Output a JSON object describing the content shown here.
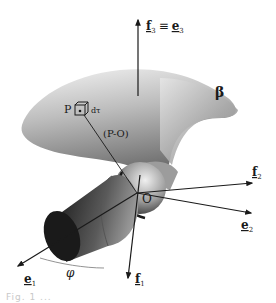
{
  "figure": {
    "type": "3d-body-coordinate-diagram",
    "body_label": "β",
    "point": {
      "label": "P",
      "element_label": "dτ",
      "vector_label": "(P-O)"
    },
    "origin_label": "O",
    "angle_label": "φ",
    "axes": [
      {
        "id": "f3",
        "label": "f",
        "sub": "3",
        "equiv": "≡",
        "label2": "e",
        "sub2": "3",
        "direction": "up"
      },
      {
        "id": "f2",
        "label": "f",
        "sub": "2",
        "direction": "right-up"
      },
      {
        "id": "e2",
        "label": "e",
        "sub": "2",
        "direction": "right-down"
      },
      {
        "id": "e1",
        "label": "e",
        "sub": "1",
        "direction": "left-down"
      },
      {
        "id": "f1",
        "label": "f",
        "sub": "1",
        "direction": "down"
      }
    ],
    "caption": "Fig. 1 ..."
  },
  "colors": {
    "ink": "#1a1a1a",
    "body_light": "#e8e8e8",
    "body_dark": "#6a6a6a",
    "cylinder_dark": "#2a2a2a"
  }
}
